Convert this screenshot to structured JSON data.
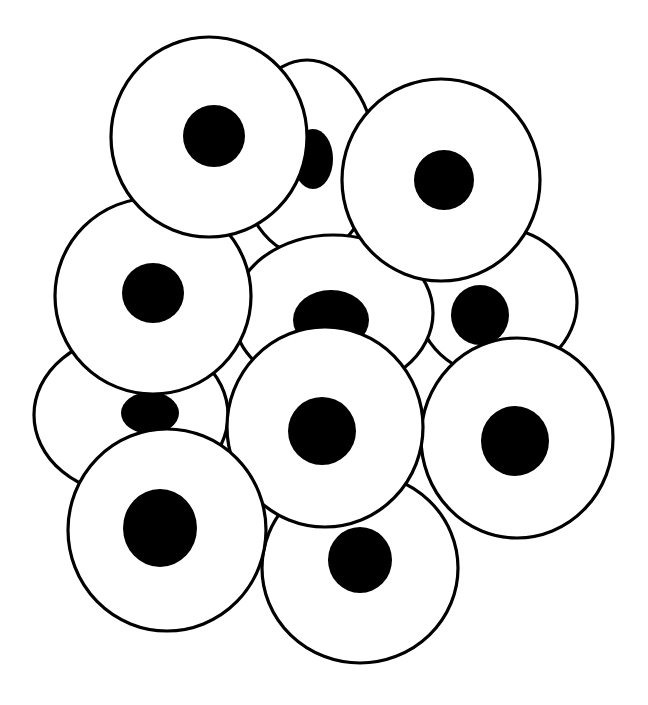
{
  "illustration": {
    "subject": "cluster of round cells with dark nuclei",
    "background": "#ffffff",
    "stroke_color": "#000000",
    "nucleus_color": "#000000",
    "cells": [
      {
        "id": "cell-top-back",
        "cx": 307,
        "cy": 158,
        "rx": 68,
        "ry": 98,
        "nx": 313,
        "ny": 159,
        "nrx": 20,
        "nry": 30
      },
      {
        "id": "cell-right-middle-back",
        "cx": 497,
        "cy": 302,
        "rx": 80,
        "ry": 74,
        "nx": 480,
        "ny": 315,
        "nrx": 29,
        "nry": 30
      },
      {
        "id": "cell-left-lower-back",
        "cx": 131,
        "cy": 415,
        "rx": 97,
        "ry": 80,
        "nx": 150,
        "ny": 413,
        "nrx": 29,
        "nry": 21
      },
      {
        "id": "cell-bottom-middle",
        "cx": 360,
        "cy": 568,
        "rx": 98,
        "ry": 95,
        "nx": 360,
        "ny": 560,
        "nrx": 32,
        "nry": 33
      },
      {
        "id": "cell-right-lower",
        "cx": 517,
        "cy": 438,
        "rx": 96,
        "ry": 100,
        "nx": 515,
        "ny": 441,
        "nrx": 34,
        "nry": 35
      },
      {
        "id": "cell-center",
        "cx": 333,
        "cy": 313,
        "rx": 100,
        "ry": 78,
        "nx": 331,
        "ny": 320,
        "nrx": 38,
        "nry": 30
      },
      {
        "id": "cell-left-middle",
        "cx": 153,
        "cy": 296,
        "rx": 98,
        "ry": 98,
        "nx": 153,
        "ny": 293,
        "nrx": 31,
        "nry": 30
      },
      {
        "id": "cell-top-right",
        "cx": 441,
        "cy": 180,
        "rx": 99,
        "ry": 101,
        "nx": 444,
        "ny": 180,
        "nrx": 30,
        "nry": 30
      },
      {
        "id": "cell-top-left",
        "cx": 209,
        "cy": 137,
        "rx": 98,
        "ry": 100,
        "nx": 214,
        "ny": 136,
        "nrx": 31,
        "nry": 31
      },
      {
        "id": "cell-center-lower",
        "cx": 325,
        "cy": 427,
        "rx": 98,
        "ry": 100,
        "nx": 322,
        "ny": 431,
        "nrx": 34,
        "nry": 34
      },
      {
        "id": "cell-bottom-left",
        "cx": 167,
        "cy": 530,
        "rx": 99,
        "ry": 101,
        "nx": 160,
        "ny": 528,
        "nrx": 37,
        "nry": 39
      }
    ]
  }
}
